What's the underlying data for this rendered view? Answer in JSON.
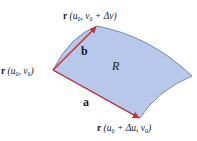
{
  "diagram": {
    "region_label": "R",
    "vector_a_label": "a",
    "vector_b_label": "b",
    "point_origin": {
      "bold": "r",
      "args": "(u",
      "sub0": "0",
      "mid": ", v",
      "sub1": "0",
      "end": ")"
    },
    "point_top": {
      "bold": "r",
      "args": "(u",
      "sub0": "0",
      "mid": ", v",
      "sub1": "0",
      "end": " + Δv)"
    },
    "point_bottom": {
      "bold": "r",
      "args": "(u",
      "sub0": "0",
      "mid": " + Δu, v",
      "sub1": "0",
      "end": ")"
    },
    "colors": {
      "region_fill": "#b7c8ea",
      "region_stroke": "#5a6fa8",
      "vector": "#d22a2a"
    }
  }
}
